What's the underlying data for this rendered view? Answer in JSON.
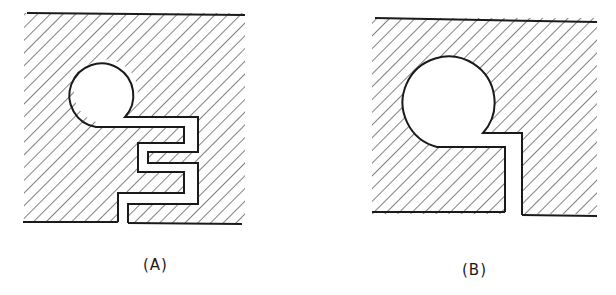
{
  "figure": {
    "panels": [
      {
        "id": "A",
        "label": "(A)",
        "description": "Hatched solid block with small circular cavity connected to a serpentine (meandering) slot exiting at the bottom edge"
      },
      {
        "id": "B",
        "label": "(B)",
        "description": "Hatched solid block with large circular cavity connected to a straight narrow slot exiting at the bottom edge"
      }
    ],
    "colors": {
      "line": "#1a1a1a",
      "background": "#ffffff"
    }
  }
}
